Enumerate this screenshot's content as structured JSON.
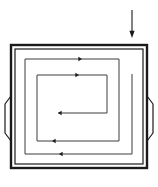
{
  "figure": {
    "type": "technical-line-diagram",
    "background_color": "#ffffff",
    "stroke_color": "#1a1a1a",
    "thin_stroke_color": "#3c3c3c",
    "canvas": {
      "width": 158,
      "height": 187
    }
  },
  "incident_arrow": {
    "name": "incoming-arrow",
    "label": "",
    "direction": "down",
    "x": 132,
    "y_start": 10,
    "y_end": 38,
    "head_size": 4.2,
    "stroke_width": 1.1
  },
  "enclosure": {
    "name": "square-enclosure",
    "outer": {
      "x": 11,
      "y": 45,
      "width": 136,
      "height": 123
    },
    "inner": {
      "x": 15,
      "y": 49,
      "width": 128,
      "height": 115
    },
    "outer_stroke_width": 2.4,
    "inner_stroke_width": 1.2
  },
  "tabs": [
    {
      "name": "left-side-tab",
      "side": "left",
      "points": "11,96 5,104 5,133 11,141",
      "stroke_width": 1.2
    },
    {
      "name": "right-side-tab",
      "side": "right",
      "points": "147,96 153,104 153,133 147,141",
      "stroke_width": 1.2
    }
  ],
  "spiral": {
    "name": "inward-spiral-path",
    "description": "Single continuous line entering from the top right, winding inward counter-clockwise to the centre",
    "stroke_width": 1.0,
    "path": "M 132,74 L 132,154 L 25,154 L 25,59 L 119,59 L 119,141 L 37,141 L 37,75 L 107,75 L 107,113 L 58,113",
    "turns": 2.5,
    "start": {
      "x": 132,
      "y": 74
    },
    "end": {
      "x": 58,
      "y": 113
    }
  },
  "arrowheads": [
    {
      "name": "arrowhead-outer-bottom",
      "x": 59,
      "y": 154,
      "direction": "left",
      "size": 3.6
    },
    {
      "name": "arrowhead-outer-top",
      "x": 82,
      "y": 59,
      "direction": "right",
      "size": 3.6
    },
    {
      "name": "arrowhead-middle-bottom",
      "x": 52,
      "y": 141,
      "direction": "left",
      "size": 3.6
    },
    {
      "name": "arrowhead-inner-top",
      "x": 79,
      "y": 75,
      "direction": "right",
      "size": 3.6
    },
    {
      "name": "arrowhead-center-end",
      "x": 58,
      "y": 113,
      "direction": "left",
      "size": 3.6
    }
  ]
}
